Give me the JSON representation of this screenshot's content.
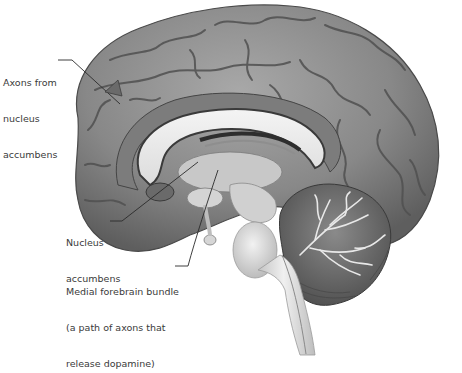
{
  "figure": {
    "colors": {
      "cortex": "#8a8a8a",
      "cortex_dark": "#5a5a5a",
      "white_matter": "#e6e6e6",
      "brainstem": "#d9d9d9",
      "cerebellum": "#6e6e6e",
      "label_text": "#3a3a3a",
      "leader_line": "#2a2a2a"
    }
  },
  "labels": [
    {
      "id": "axons",
      "lines": [
        "Axons from",
        "nucleus",
        "accumbens"
      ]
    },
    {
      "id": "nucleus-accumbens",
      "lines": [
        "Nucleus",
        "accumbens"
      ]
    },
    {
      "id": "medial-forebrain-bundle",
      "lines": [
        "Medial forebrain bundle",
        "(a path of axons that",
        "release dopamine)"
      ]
    }
  ]
}
